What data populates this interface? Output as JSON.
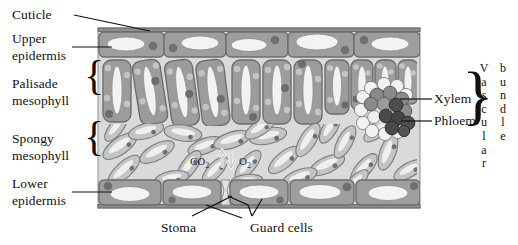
{
  "figure": {
    "type": "biology-diagram"
  },
  "labels": {
    "cuticle": "Cuticle",
    "upper_epidermis_line1": "Upper",
    "upper_epidermis_line2": "epidermis",
    "palisade_line1": "Palisade",
    "palisade_line2": "mesophyll",
    "spongy_line1": "Spongy",
    "spongy_line2": "mesophyll",
    "lower_epidermis_line1": "Lower",
    "lower_epidermis_line2": "epidermis",
    "xylem": "Xylem",
    "phloem": "Phloem",
    "stoma": "Stoma",
    "guard_cells": "Guard cells",
    "vascular_vertical": "Vascular",
    "bundle_vertical": "bundle",
    "brace_glyph": "}",
    "brace_glyph_left": "{"
  },
  "gas_exchange": {
    "co2": "CO",
    "co2_sub": "2",
    "o2": "O",
    "o2_sub": "2",
    "arrow_in": "up-arrow",
    "arrow_out": "down-arrow"
  },
  "colors": {
    "background": "#ffffff",
    "mesophyll_air": "#d8d8d8",
    "epidermis_fill": "#9e9e9e",
    "epidermis_stroke": "#6e6e6e",
    "palisade_fill": "#9c9c9c",
    "palisade_stroke": "#6b6b6b",
    "spongy_fill": "#c2c2c2",
    "spongy_stroke": "#7c7c7c",
    "vacuole": "#f2f2f2",
    "nucleus": "#6a6a6a",
    "chloroplast": "#bdbdbd",
    "xylem": "#8a8a8a",
    "phloem": "#4a4a4a",
    "bundle_sheath": "#f0f0f0",
    "cuticle": "#5c5c5c",
    "leader_line": "#111111",
    "text": "#111111"
  },
  "structure": {
    "leaf_left": 98,
    "leaf_right": 420,
    "leaf_top": 28,
    "leaf_bottom": 208,
    "upper_epidermis_cells": 5,
    "lower_epidermis_cells": 5,
    "palisade_cells": 11,
    "spongy_cells": 26,
    "xylem_cells": 9,
    "phloem_cells": 8
  }
}
